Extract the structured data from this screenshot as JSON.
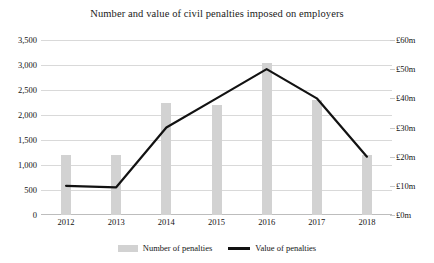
{
  "chart_data": {
    "type": "bar",
    "title": "Number and value of civil penalties imposed on employers",
    "categories": [
      "2012",
      "2013",
      "2014",
      "2015",
      "2016",
      "2017",
      "2018"
    ],
    "xlabel": "",
    "ylabel": "",
    "grid": true,
    "legend_position": "bottom",
    "series": [
      {
        "name": "Number of penalties",
        "type": "bar",
        "axis": "left",
        "color": "#d2d2d2",
        "values": [
          1200,
          1200,
          2250,
          2200,
          3050,
          2300,
          1200
        ]
      },
      {
        "name": "Value of penalties",
        "type": "line",
        "axis": "right",
        "color": "#121212",
        "values": [
          10,
          9.5,
          30,
          40,
          50,
          40,
          20
        ]
      }
    ],
    "y_left": {
      "min": 0,
      "max": 3500,
      "step": 500,
      "ticks": [
        "0",
        "500",
        "1,000",
        "1,500",
        "2,000",
        "2,500",
        "3,000",
        "3,500"
      ]
    },
    "y_right": {
      "min": 0,
      "max": 60,
      "step": 10,
      "unit": "£m",
      "ticks": [
        "£0m",
        "£10m",
        "£20m",
        "£30m",
        "£40m",
        "£50m",
        "£60m"
      ]
    }
  }
}
